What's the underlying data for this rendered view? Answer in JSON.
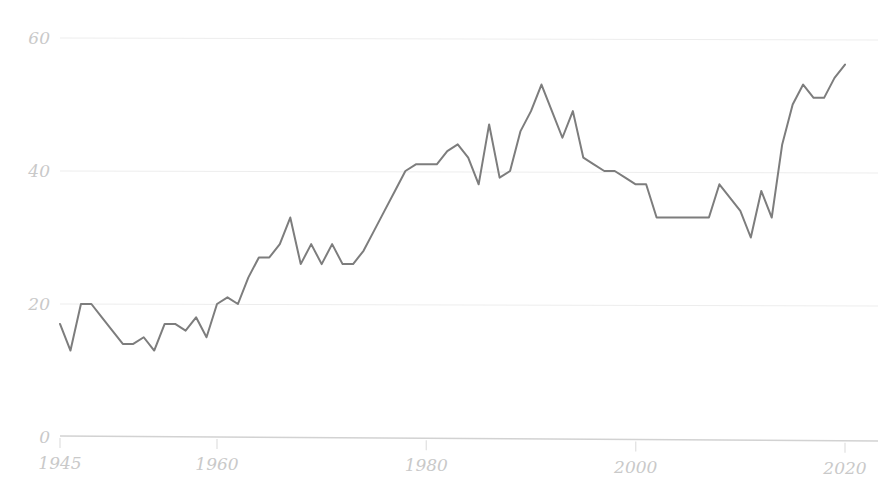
{
  "chart_data": {
    "type": "line",
    "title": "",
    "subtitle": "",
    "xlabel": "",
    "ylabel": "",
    "xlim": [
      1945,
      2020
    ],
    "ylim": [
      0,
      62
    ],
    "grid": true,
    "legend": null,
    "legend_position": "none",
    "line_color": "#7d7d7d",
    "axis_color": "#d2d2d2",
    "gridline_color": "#ededed",
    "tick_label_color": "#c9c9c9",
    "background_color": "#ffffff",
    "y_ticks": [
      0,
      20,
      40,
      60
    ],
    "y_tick_labels": [
      "0",
      "20",
      "40",
      "60"
    ],
    "x_ticks": [
      1945,
      1960,
      1980,
      2000,
      2020
    ],
    "x_tick_labels": [
      "1945",
      "1960",
      "1980",
      "2000",
      "2020"
    ],
    "series": [
      {
        "name": "series-1",
        "x": [
          1945,
          1946,
          1947,
          1948,
          1949,
          1950,
          1951,
          1952,
          1953,
          1954,
          1955,
          1956,
          1957,
          1958,
          1959,
          1960,
          1961,
          1962,
          1963,
          1964,
          1965,
          1966,
          1967,
          1968,
          1969,
          1970,
          1971,
          1972,
          1973,
          1974,
          1975,
          1976,
          1977,
          1978,
          1979,
          1980,
          1981,
          1982,
          1983,
          1984,
          1985,
          1986,
          1987,
          1988,
          1989,
          1990,
          1991,
          1992,
          1993,
          1994,
          1995,
          1996,
          1997,
          1998,
          1999,
          2000,
          2001,
          2002,
          2003,
          2004,
          2005,
          2006,
          2007,
          2008,
          2009,
          2010,
          2011,
          2012,
          2013,
          2014,
          2015,
          2016,
          2017,
          2018,
          2019,
          2020
        ],
        "y": [
          17,
          13,
          20,
          20,
          18,
          16,
          14,
          14,
          15,
          13,
          17,
          17,
          16,
          18,
          15,
          20,
          21,
          20,
          24,
          27,
          27,
          29,
          33,
          26,
          29,
          26,
          29,
          26,
          26,
          28,
          31,
          34,
          37,
          40,
          41,
          41,
          41,
          43,
          44,
          42,
          38,
          47,
          39,
          40,
          46,
          49,
          53,
          49,
          45,
          49,
          42,
          41,
          40,
          40,
          39,
          38,
          38,
          33,
          33,
          33,
          33,
          33,
          33,
          38,
          36,
          34,
          30,
          37,
          33,
          44,
          50,
          53,
          51,
          51,
          54,
          56
        ]
      }
    ]
  },
  "plot_geometry": {
    "x_pixel_1945": 60,
    "x_pixel_2020": 845,
    "y_pixel_0": 437,
    "y_pixel_60": 38
  }
}
